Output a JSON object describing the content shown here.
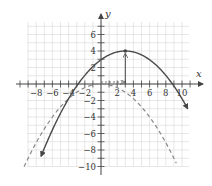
{
  "chart_data": {
    "type": "line",
    "title": "",
    "xlabel": "x",
    "ylabel": "y",
    "xlim": [
      -9,
      11
    ],
    "ylim": [
      -10,
      7.5
    ],
    "grid": true,
    "x_ticks": [
      -8,
      -6,
      -4,
      -2,
      2,
      4,
      6,
      8,
      10
    ],
    "y_ticks": [
      6,
      4,
      2,
      -2,
      -4,
      -6,
      -8,
      -10
    ],
    "series": [
      {
        "name": "translated parabola",
        "style": "solid",
        "color": "#555555",
        "vertex": [
          3,
          4
        ],
        "equation": "y = -(1/9)(x-3)^2 + 4",
        "x_intercepts": [
          -3,
          9
        ],
        "endpoints_with_arrows": [
          [
            -7.4,
            -9.7
          ],
          [
            10.7,
            -3.8
          ]
        ]
      },
      {
        "name": "original parabola",
        "style": "dashed",
        "color": "#888888",
        "vertex": [
          0,
          0
        ],
        "equation": "y = -(1/9)x^2",
        "endpoints": [
          [
            -9.5,
            -10
          ],
          [
            9.3,
            -10
          ]
        ]
      }
    ],
    "annotations": [
      {
        "type": "arrow",
        "from": [
          0,
          0
        ],
        "to": [
          3,
          0
        ],
        "style": "dashed",
        "meaning": "horizontal shift 3"
      },
      {
        "type": "arrow",
        "from": [
          3,
          0
        ],
        "to": [
          3,
          4
        ],
        "style": "solid",
        "meaning": "vertical shift 4"
      },
      {
        "type": "point",
        "at": [
          3,
          4
        ]
      }
    ]
  },
  "labels": {
    "x_axis": "x",
    "y_axis": "y",
    "x_ticks": [
      "−8",
      "−6",
      "−4",
      "−2",
      "2",
      "4",
      "6",
      "8",
      "10"
    ],
    "y_ticks": [
      "6",
      "4",
      "2",
      "−2",
      "−4",
      "−6",
      "−8",
      "−10"
    ]
  }
}
